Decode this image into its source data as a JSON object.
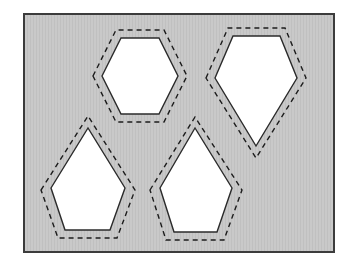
{
  "figure": {
    "title": "",
    "type": "nesting-layout-diagram",
    "canvas": {
      "width": 354,
      "height": 272
    }
  },
  "sheet": {
    "name": "stock-sheet",
    "x": 24,
    "y": 14,
    "width": 310,
    "height": 238,
    "fill_color": "#c9c9c9",
    "hatch_color": "#bdbdbd",
    "border_color": "#3c3c3c",
    "border_width": 2,
    "label": ""
  },
  "style": {
    "part_fill": "#ffffff",
    "part_stroke": "#2b2b2b",
    "part_stroke_width": 1.4,
    "offset_stroke": "#1c1c1c",
    "offset_stroke_width": 1.4,
    "offset_dash": "5 4"
  },
  "parts": [
    {
      "id": "part-1",
      "name": "hexagon-top-left",
      "shape": "hexagon",
      "label": "",
      "outline": "102,76 121,38 159,38 178,76 159,114 121,114",
      "offset_outline": "93,76 116,30 164,30 187,76 164,122 116,122"
    },
    {
      "id": "part-2",
      "name": "pentagon-top-right",
      "shape": "pentagon",
      "label": "",
      "outline": "215,78 233,36 280,36 297,78 256,146",
      "offset_outline": "206,78 228,28 285,28 306,78 256,158"
    },
    {
      "id": "part-3",
      "name": "pentagon-bottom-left",
      "shape": "pentagon",
      "label": "",
      "outline": "51,188 88,128 125,188 110,230 65,230"
    },
    {
      "id": "part-3-offset",
      "name": "pentagon-bottom-left-offset",
      "shape": "pentagon-offset",
      "label": "",
      "offset_outline": "41,190 88,116 135,190 117,238 58,238"
    },
    {
      "id": "part-4",
      "name": "pentagon-bottom-middle",
      "shape": "pentagon",
      "label": "",
      "outline": "160,188 195,128 232,188 217,232 174,232"
    },
    {
      "id": "part-4-offset",
      "name": "pentagon-bottom-middle-offset",
      "shape": "pentagon-offset",
      "label": "",
      "offset_outline": "150,190 195,117 242,190 224,240 166,240"
    }
  ],
  "parts_index": {
    "p0_outline": "102,76 121,38 159,38 178,76 159,114 121,114",
    "p0_offset": "93,76 116,30 164,30 187,76 164,122 116,122",
    "p1_outline": "215,78 233,36 280,36 297,78 256,146",
    "p1_offset": "206,78 228,28 285,28 306,78 256,158",
    "p2_outline": "51,188 88,128 125,188 110,230 65,230",
    "p2_offset": "41,190 88,116 135,190 117,238 58,238",
    "p3_outline": "160,188 195,128 232,188 217,232 174,232",
    "p3_offset": "150,190 195,117 242,190 224,240 166,240"
  }
}
